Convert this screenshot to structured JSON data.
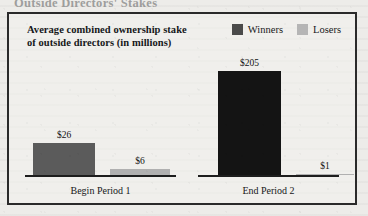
{
  "clipped_heading": "Outside Directors' Stakes",
  "chart_data": {
    "type": "bar",
    "title": "Average combined ownership stake of outside directors (in millions)",
    "title_line1": "Average combined ownership stake",
    "title_line2": "of outside directors (in millions)",
    "xlabel": "",
    "ylabel": "",
    "categories": [
      "Begin Period 1",
      "End Period 2"
    ],
    "series": [
      {
        "name": "Winners",
        "color": "#4a4a4a",
        "values": [
          26,
          205
        ],
        "labels": [
          "$26",
          "$205"
        ]
      },
      {
        "name": "Losers",
        "color": "#b5b5b5",
        "values": [
          6,
          1
        ],
        "labels": [
          "$6",
          "$1"
        ]
      }
    ],
    "value_prefix": "$",
    "ylim": [
      0,
      230
    ],
    "grid": false,
    "legend_position": "top-right",
    "frame": true
  },
  "legend": {
    "items": [
      {
        "label": "Winners",
        "color": "#4a4a4a"
      },
      {
        "label": "Losers",
        "color": "#b5b5b5"
      }
    ]
  },
  "groups": [
    {
      "label": "Begin Period 1",
      "bars": [
        {
          "series": "Winners",
          "label": "$26"
        },
        {
          "series": "Losers",
          "label": "$6"
        }
      ]
    },
    {
      "label": "End Period 2",
      "bars": [
        {
          "series": "Winners",
          "label": "$205"
        },
        {
          "series": "Losers",
          "label": "$1"
        }
      ]
    }
  ]
}
